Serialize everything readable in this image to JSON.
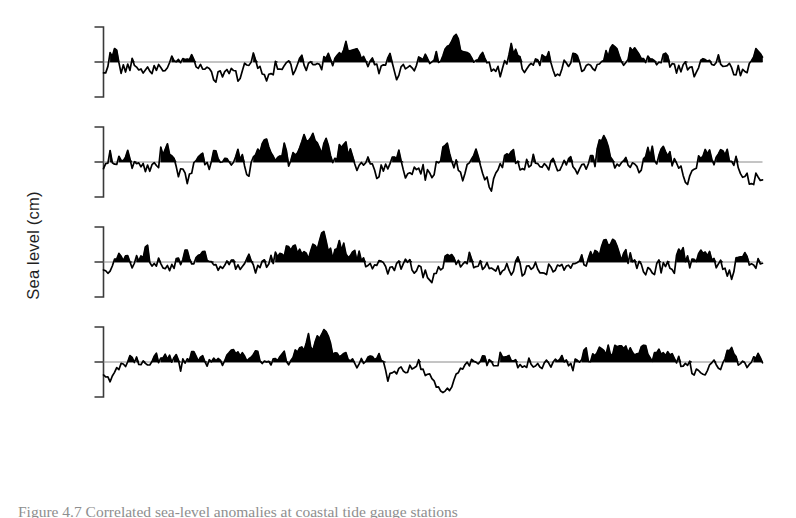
{
  "figure": {
    "ylabel": "Sea level (cm)",
    "xlim": [
      1950,
      1975
    ],
    "ylim": [
      -25,
      25
    ],
    "yticks": [
      "20",
      "0",
      "–20"
    ],
    "ytick_values": [
      20,
      0,
      -20
    ],
    "xticks": [
      "1950",
      "1955",
      "1960",
      "1965",
      "1970",
      "1975"
    ],
    "xtick_values": [
      1950,
      1955,
      1960,
      1965,
      1970,
      1975
    ],
    "series_color": "#000000",
    "zero_line_color": "#8a8a8a",
    "axis_color": "#3a3a3a",
    "background": "#ffffff",
    "caption_partial": "Figure 4.7  Correlated sea-level anomalies at coastal tide gauge stations"
  },
  "chart_data": {
    "type": "line",
    "title": "",
    "xlabel": "",
    "ylabel": "Sea level (cm)",
    "xlim": [
      1950,
      1975
    ],
    "ylim": [
      -25,
      25
    ],
    "grid": false,
    "legend": "none",
    "fill_positive": true,
    "sampling": "monthly",
    "points_per_series": 300,
    "panels": [
      {
        "name": "sitka",
        "label": "Sitka, Alaska",
        "seed": 1171,
        "noise_amp": 5.4,
        "rough": 0.72,
        "smooth_amp": 3.0,
        "trend": 0.0,
        "offset": 0.6,
        "events": [
          {
            "center": 1950.05,
            "width": 0.1,
            "amp": -13.0
          },
          {
            "center": 1952.9,
            "width": 0.22,
            "amp": 6.5
          },
          {
            "center": 1957.6,
            "width": 0.55,
            "amp": 3.2
          },
          {
            "center": 1958.1,
            "width": 0.3,
            "amp": 4.0
          },
          {
            "center": 1960.6,
            "width": 0.5,
            "amp": -5.5
          },
          {
            "center": 1961.5,
            "width": 0.45,
            "amp": -6.5
          },
          {
            "center": 1963.2,
            "width": 0.3,
            "amp": 7.0
          },
          {
            "center": 1969.3,
            "width": 0.22,
            "amp": 8.5
          },
          {
            "center": 1970.2,
            "width": 0.35,
            "amp": 6.0
          },
          {
            "center": 1971.6,
            "width": 0.4,
            "amp": -7.5
          },
          {
            "center": 1972.5,
            "width": 0.35,
            "amp": -9.0
          },
          {
            "center": 1973.6,
            "width": 0.4,
            "amp": -6.0
          }
        ]
      },
      {
        "name": "neah-bay",
        "label": "Neah Bay, Washington",
        "seed": 2297,
        "noise_amp": 6.0,
        "rough": 0.74,
        "smooth_amp": 3.4,
        "trend": 0.0,
        "offset": 0.4,
        "events": [
          {
            "center": 1952.3,
            "width": 0.25,
            "amp": 6.0
          },
          {
            "center": 1953.6,
            "width": 0.22,
            "amp": 7.5
          },
          {
            "center": 1955.1,
            "width": 0.2,
            "amp": 11.5
          },
          {
            "center": 1957.9,
            "width": 0.35,
            "amp": 10.0
          },
          {
            "center": 1958.3,
            "width": 0.25,
            "amp": 8.0
          },
          {
            "center": 1960.4,
            "width": 0.4,
            "amp": -8.5
          },
          {
            "center": 1961.3,
            "width": 0.35,
            "amp": -7.0
          },
          {
            "center": 1963.0,
            "width": 0.25,
            "amp": 8.0
          },
          {
            "center": 1964.6,
            "width": 0.35,
            "amp": -9.0
          },
          {
            "center": 1968.9,
            "width": 0.22,
            "amp": 11.0
          },
          {
            "center": 1970.4,
            "width": 0.3,
            "amp": -6.5
          },
          {
            "center": 1972.1,
            "width": 0.35,
            "amp": -7.0
          },
          {
            "center": 1973.2,
            "width": 0.3,
            "amp": 6.5
          },
          {
            "center": 1974.5,
            "width": 0.3,
            "amp": -9.5
          }
        ]
      },
      {
        "name": "san-francisco",
        "label": "San Francisco, California",
        "seed": 3391,
        "noise_amp": 3.6,
        "rough": 0.6,
        "smooth_amp": 2.6,
        "trend": 0.0,
        "offset": 0.2,
        "events": [
          {
            "center": 1950.1,
            "width": 0.18,
            "amp": -6.5
          },
          {
            "center": 1951.6,
            "width": 0.5,
            "amp": 4.5
          },
          {
            "center": 1953.0,
            "width": 0.7,
            "amp": 5.5
          },
          {
            "center": 1957.6,
            "width": 0.8,
            "amp": 6.5
          },
          {
            "center": 1958.4,
            "width": 0.6,
            "amp": 6.0
          },
          {
            "center": 1960.8,
            "width": 0.45,
            "amp": -5.5
          },
          {
            "center": 1962.0,
            "width": 0.4,
            "amp": -6.0
          },
          {
            "center": 1963.4,
            "width": 0.4,
            "amp": 5.0
          },
          {
            "center": 1964.8,
            "width": 0.35,
            "amp": -6.5
          },
          {
            "center": 1968.6,
            "width": 0.45,
            "amp": 5.5
          },
          {
            "center": 1969.5,
            "width": 0.55,
            "amp": 7.5
          },
          {
            "center": 1971.2,
            "width": 0.5,
            "amp": -5.0
          },
          {
            "center": 1972.9,
            "width": 0.45,
            "amp": 7.0
          },
          {
            "center": 1973.6,
            "width": 0.35,
            "amp": -7.0
          }
        ]
      },
      {
        "name": "san-diego",
        "label": "San Diego, California",
        "seed": 4493,
        "noise_amp": 2.6,
        "rough": 0.55,
        "smooth_amp": 2.2,
        "trend": 0.0,
        "offset": 0.2,
        "events": [
          {
            "center": 1950.1,
            "width": 0.18,
            "amp": -5.0
          },
          {
            "center": 1952.4,
            "width": 0.6,
            "amp": 3.5
          },
          {
            "center": 1957.8,
            "width": 0.7,
            "amp": 6.0
          },
          {
            "center": 1958.5,
            "width": 0.7,
            "amp": 6.5
          },
          {
            "center": 1959.4,
            "width": 0.4,
            "amp": 4.0
          },
          {
            "center": 1961.0,
            "width": 0.45,
            "amp": -5.0
          },
          {
            "center": 1962.6,
            "width": 0.5,
            "amp": -8.0
          },
          {
            "center": 1963.0,
            "width": 0.35,
            "amp": -7.0
          },
          {
            "center": 1965.6,
            "width": 0.45,
            "amp": 4.0
          },
          {
            "center": 1968.9,
            "width": 0.45,
            "amp": 5.0
          },
          {
            "center": 1969.6,
            "width": 0.5,
            "amp": 7.5
          },
          {
            "center": 1971.0,
            "width": 0.4,
            "amp": 4.5
          },
          {
            "center": 1972.6,
            "width": 0.45,
            "amp": -9.0
          },
          {
            "center": 1973.8,
            "width": 0.35,
            "amp": 3.0
          }
        ]
      }
    ]
  }
}
